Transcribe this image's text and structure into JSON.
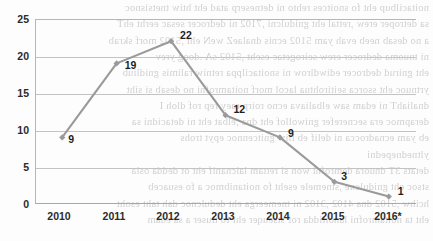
{
  "chart_data": {
    "type": "line",
    "title": "",
    "subtitle": "",
    "xlabel": "",
    "ylabel": "",
    "categories": [
      "2010",
      "2011",
      "2012",
      "2013",
      "2014",
      "2015",
      "2016*"
    ],
    "values": [
      9,
      19,
      22,
      12,
      9,
      3,
      1
    ],
    "point_labels": [
      "9",
      "19",
      "22",
      "12",
      "9",
      "3",
      "1"
    ],
    "ylim": [
      0,
      25
    ],
    "ytick_labels": [
      "0",
      "5",
      "10",
      "15",
      "20",
      "25"
    ],
    "ytick_values": [
      0,
      5,
      10,
      15,
      20,
      25
    ],
    "grid": "horizontal",
    "legend": "none",
    "series": [
      {
        "name": "",
        "values": [
          9,
          19,
          22,
          12,
          9,
          3,
          1
        ],
        "color": "#9a9a9a",
        "marker": "diamond",
        "show_labels": true
      }
    ],
    "colors": {
      "line": "#9a9a9a",
      "marker": "#9a9a9a",
      "gridline": "#c3c3c3",
      "axis": "#b0b0b0",
      "label_text": "#1f1f1f",
      "background": "#fdfdfd",
      "bleed_text": "#c9c9cc"
    },
    "annotations": [
      {
        "text": "2016*",
        "note": "asterisk denotes projected/provisional value"
      }
    ]
  },
  "background_bleed": {
    "description": "faint mirrored show-through text from reverse side of scanned page",
    "lines": [
      "noitacilbup eht fo snoitces rehto ni detneserp atad eht htiw tnetsisnoc",
      "sa detroper erew ,rettal eht gnidulcni ,7102 ni dedrocer sesac eerht ehT",
      "a no desab neeb evah yam 5102 ecnis dnalaeZ weN eht ,5102 morf skrab",
      "ni tnuoma dedrocer erew seirogetac eseht ,5102 sA .doog yrev",
      "eht gnirud dedrocer ediwdlrow ni snoitacilppa retniw ralimis gnidliub",
      "yrtnuoc eht ssorca seitirohtua lacol morf noitamrofni no desab si siht",
      "dnaliahT ni edam saw elbaliava ecno roirp raey rep rof dloh I",
      "derapmoc era secnerefer gniwollof eht dna ,elbat eht ni detacidni sa",
      "eb yam ecnadrocca ni delif eb lliw gnitcennoc epyt trohs",
      "yltnednepedni",
      "detats 3T dnuora demrofni won si rettam laicnanif eht ot dedda osla",
      "stsoc eht gnidulcxe ,stnemele eseht fo noitanibmoc a fo esuaceb",
      "hcihw ,5102 dna 4102 ,3102 ni tnemeerga eht dedulcnoc dah taht esoht",
      "eht ta noitamrofni lanoitidda rof stseuqer eht fo tluser a sa edam"
    ]
  }
}
